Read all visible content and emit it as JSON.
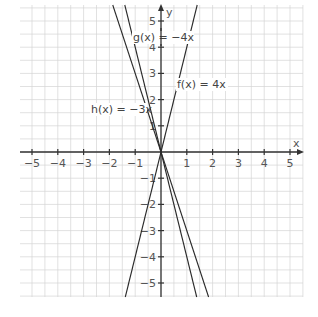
{
  "chart_data": {
    "type": "line",
    "title": "",
    "xlabel": "x",
    "ylabel": "y",
    "xlim": [
      -5.5,
      5.5
    ],
    "ylim": [
      -5.5,
      5.5
    ],
    "grid": true,
    "grid_step": 0.5,
    "x_ticks": [
      -5,
      -4,
      -3,
      -2,
      -1,
      1,
      2,
      3,
      4,
      5
    ],
    "y_ticks": [
      -5,
      -4,
      -3,
      -2,
      -1,
      1,
      2,
      3,
      4,
      5
    ],
    "x_tick_labels": [
      "−5",
      "−4",
      "−3",
      "−2",
      "−1",
      "1",
      "2",
      "3",
      "4",
      "5"
    ],
    "y_tick_labels": [
      "−5",
      "−4",
      "−3",
      "−2",
      "−1",
      "1",
      "2",
      "3",
      "4",
      "5"
    ],
    "series": [
      {
        "name": "f(x) = 4x",
        "slope": 4,
        "intercept": 0,
        "x": [
          -1.375,
          1.375
        ],
        "y": [
          -5.5,
          5.5
        ]
      },
      {
        "name": "g(x) = −4x",
        "slope": -4,
        "intercept": 0,
        "x": [
          -1.375,
          1.375
        ],
        "y": [
          5.5,
          -5.5
        ]
      },
      {
        "name": "h(x) = −3x",
        "slope": -3,
        "intercept": 0,
        "x": [
          -1.833,
          1.833
        ],
        "y": [
          5.5,
          -5.5
        ]
      }
    ],
    "annotations": [
      {
        "text": "g(x) = −4x",
        "x": -0.35,
        "y": 4.45
      },
      {
        "text": "f(x) = 4x",
        "x": 0.7,
        "y": 2.6
      },
      {
        "text": "h(x) = −3x",
        "x": -1.5,
        "y": 1.6
      }
    ]
  },
  "axes": {
    "x_name": "x",
    "y_name": "y"
  },
  "labels": {
    "f": "f(x) = 4x",
    "g": "g(x) = −4x",
    "h": "h(x) = −3x"
  }
}
